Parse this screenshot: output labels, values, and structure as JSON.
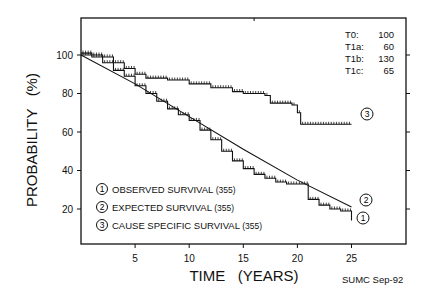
{
  "chart_data": {
    "type": "line",
    "title": "",
    "xlabel": "TIME   (YEARS)",
    "ylabel": "PROBABILITY   (%)",
    "xlim": [
      0,
      30
    ],
    "ylim": [
      0,
      110
    ],
    "x_ticks": [
      5,
      10,
      15,
      20,
      25
    ],
    "y_ticks": [
      20,
      40,
      60,
      80,
      100
    ],
    "grid": false,
    "legend_position": "lower-left",
    "series": [
      {
        "id": "1",
        "name": "OBSERVED SURVIVAL",
        "n": "(355)",
        "style": "step",
        "x": [
          0,
          1,
          2,
          3,
          4,
          5,
          6,
          7,
          8,
          9,
          10,
          11,
          12,
          13,
          14,
          15,
          16,
          17,
          18,
          19,
          20,
          21,
          22,
          23,
          24,
          25,
          25
        ],
        "y": [
          100,
          99,
          96,
          92,
          89,
          84,
          80,
          76,
          72,
          69,
          66,
          61,
          56,
          50,
          45,
          41,
          38,
          36,
          34,
          33,
          33,
          25,
          22,
          20,
          19,
          19,
          14
        ]
      },
      {
        "id": "2",
        "name": "EXPECTED SURVIVAL",
        "n": "(355)",
        "style": "smooth",
        "x": [
          0,
          5,
          10,
          15,
          20,
          25
        ],
        "y": [
          100,
          85,
          68,
          51,
          35,
          21
        ]
      },
      {
        "id": "3",
        "name": "CAUSE SPECIFIC SURVIVAL",
        "n": "(355)",
        "style": "step",
        "x": [
          0,
          1,
          2,
          3,
          4,
          5,
          6,
          8,
          10,
          12,
          14,
          15,
          17,
          17.5,
          19.5,
          20,
          20.3,
          25
        ],
        "y": [
          101,
          100,
          99,
          96,
          93,
          90,
          88,
          87,
          85,
          83,
          81,
          80,
          79,
          75,
          74,
          70,
          64,
          64
        ]
      }
    ],
    "annotations": {
      "stats": [
        {
          "label": "T0:",
          "value": "100"
        },
        {
          "label": "T1a:",
          "value": "60"
        },
        {
          "label": "T1b:",
          "value": "130"
        },
        {
          "label": "T1c:",
          "value": "65"
        }
      ],
      "credit": "SUMC Sep-92",
      "curve_markers": [
        "1",
        "2",
        "3"
      ]
    }
  }
}
